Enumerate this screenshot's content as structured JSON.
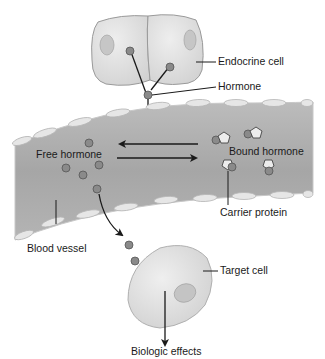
{
  "diagram": {
    "labels": {
      "endocrine_cell": "Endocrine cell",
      "hormone": "Hormone",
      "free_hormone": "Free hormone",
      "bound_hormone": "Bound hormone",
      "carrier_protein": "Carrier protein",
      "blood_vessel": "Blood vessel",
      "target_cell": "Target cell",
      "biologic_effects": "Biologic effects"
    },
    "colors": {
      "cell_fill": "#dcdcdc",
      "cell_stroke": "#9a9a9a",
      "nucleus_fill": "#c4c4c4",
      "vessel_fill": "#a9a9a9",
      "vessel_edge": "#c8c8c8",
      "endothelium_fill": "#e6e6e6",
      "hormone_fill": "#8a8a8a",
      "carrier_fill": "#ececec",
      "line": "#1a1a1a"
    },
    "counts": {
      "free_hormone_molecules": 6,
      "bound_complexes": 4
    }
  }
}
